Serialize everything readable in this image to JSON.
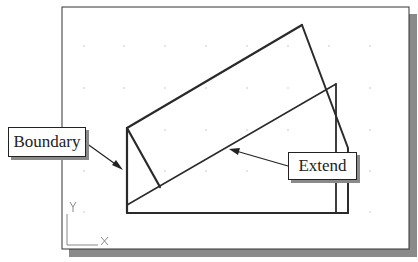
{
  "figure": {
    "type": "cad-extend-command-illustration",
    "callouts": {
      "boundary": "Boundary",
      "extend": "Extend"
    },
    "ucs_icon": {
      "x_label": "X",
      "y_label": "Y"
    },
    "colors": {
      "line": "#2a2a2a",
      "frame": "#333333",
      "shadow": "#8a8a8a",
      "grid_dot": "#bbbbbb",
      "background": "#ffffff"
    }
  }
}
